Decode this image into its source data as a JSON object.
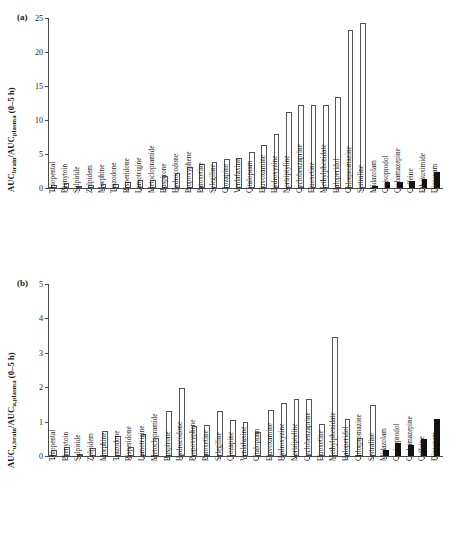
{
  "figure": {
    "panel_a_tag": "(a)",
    "panel_b_tag": "(b)"
  },
  "chart_data": [
    {
      "type": "bar",
      "panel": "(a)",
      "title": "",
      "xlabel": "",
      "ylabel": "AUCbrain/AUCplasma (0-5 h)",
      "ylabel_parts": {
        "prefix1": "AUC",
        "sub1": "brain",
        "mid": "/AUC",
        "sub2": "plasma",
        "suffix": " (0–5 h)"
      },
      "ylim": [
        0,
        25
      ],
      "yticks": [
        0,
        5,
        10,
        15,
        20,
        25
      ],
      "ytick_labels": [
        "0",
        "5",
        "10",
        "15",
        "20",
        "25"
      ],
      "grid": false,
      "legend": "none",
      "categories": [
        "Thiopental",
        "Phenytoin",
        "Sulpiride",
        "Zolpidem",
        "Morphine",
        "Trazodone",
        "Risperidone",
        "Lamotrigine",
        "Metoclopramide",
        "Buspirone",
        "Hydrocodone",
        "Propoxyphene",
        "Paroxetine",
        "Selegiline",
        "Clozapine",
        "Venlafaxine",
        "Citalopram",
        "Fluvoxamine",
        "Hydroxyzine",
        "Nortriptyline",
        "Cyclobenzaprine",
        "Fluoxetine",
        "Methylphenidate",
        "Haloperidol",
        "Chlorpromazine",
        "Sertraline",
        "Midazolam",
        "Carisoprodol",
        "Carbamazepine",
        "Caffeine",
        "Ethosuximide",
        "Diazepam"
      ],
      "values": [
        0.45,
        0.72,
        0.08,
        0.45,
        0.55,
        0.58,
        0.85,
        1.15,
        1.25,
        1.72,
        2.25,
        3.1,
        3.5,
        3.85,
        4.2,
        4.4,
        5.3,
        6.3,
        7.9,
        11.2,
        12.2,
        12.15,
        12.2,
        13.35,
        23.2,
        24.3,
        0.3,
        0.85,
        0.9,
        1.05,
        1.3,
        2.3
      ],
      "bar_styles": [
        "open",
        "open",
        "open",
        "open",
        "open",
        "open",
        "open",
        "open",
        "open",
        "open",
        "open",
        "open",
        "open",
        "open",
        "open",
        "open",
        "open",
        "open",
        "open",
        "open",
        "open",
        "open",
        "open",
        "open",
        "open",
        "open",
        "filled",
        "filled",
        "filled",
        "filled",
        "filled",
        "filled"
      ]
    },
    {
      "type": "bar",
      "panel": "(b)",
      "title": "",
      "xlabel": "",
      "ylabel": "AUCu,brain/AUCu,plasma (0-5 h)",
      "ylabel_parts": {
        "prefix1": "AUC",
        "sub1": "u,brain",
        "mid": "/AUC",
        "sub2": "u,plasma",
        "suffix": " (0–5 h)"
      },
      "ylim": [
        0,
        5
      ],
      "yticks": [
        0,
        1,
        2,
        3,
        4,
        5
      ],
      "ytick_labels": [
        "0",
        "1",
        "2",
        "3",
        "4",
        "5"
      ],
      "grid": false,
      "legend": "none",
      "categories": [
        "Thiopental",
        "Phenytoin",
        "Sulpiride",
        "Zolpidem",
        "Morphine",
        "Trazodone",
        "Risperidone",
        "Lamotrigine",
        "Metoclopramide",
        "Buspirone",
        "Hydrocodone",
        "Propoxyphene",
        "Paroxetine",
        "Selegiline",
        "Clozapine",
        "Venlafaxine",
        "Citalopram",
        "Fluvoxamine",
        "Hydroxyzine",
        "Nortriptyline",
        "Cyclobenzaprine",
        "Fluoxetine",
        "Methylphenidate",
        "Haloperidol",
        "Chlorpromazine",
        "Sertraline",
        "Midazolam",
        "Carisoprodol",
        "Carbamazepine",
        "Caffeine",
        "Diazepam"
      ],
      "values": [
        0.17,
        0.27,
        0.05,
        0.24,
        0.72,
        0.57,
        0.25,
        0.65,
        0.53,
        1.3,
        1.99,
        0.88,
        0.89,
        1.31,
        1.04,
        1.0,
        0.69,
        1.35,
        1.54,
        1.66,
        1.65,
        0.92,
        3.47,
        1.08,
        0.53,
        1.48,
        0.18,
        0.39,
        0.31,
        0.5,
        1.07
      ],
      "bar_styles": [
        "open",
        "open",
        "open",
        "open",
        "open",
        "open",
        "open",
        "open",
        "open",
        "open",
        "open",
        "open",
        "open",
        "open",
        "open",
        "open",
        "open",
        "open",
        "open",
        "open",
        "open",
        "open",
        "open",
        "open",
        "open",
        "open",
        "filled",
        "filled",
        "filled",
        "filled",
        "filled"
      ]
    }
  ]
}
